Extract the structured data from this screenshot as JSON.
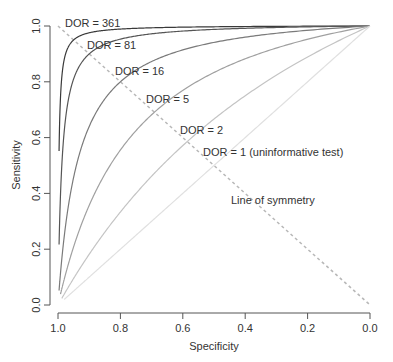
{
  "chart_data": {
    "type": "line",
    "title": "",
    "xlabel": "Specificity",
    "ylabel": "Sensitivity",
    "xlim": [
      1.0,
      0.0
    ],
    "ylim": [
      0.0,
      1.0
    ],
    "x_reversed": true,
    "grid": false,
    "legend": "none (direct labels)",
    "xticks": [
      "1.0",
      "0.8",
      "0.6",
      "0.4",
      "0.2",
      "0.0"
    ],
    "yticks": [
      "0.0",
      "0.2",
      "0.4",
      "0.6",
      "0.8",
      "1.0"
    ],
    "series": [
      {
        "name": "DOR = 361",
        "dor": 361,
        "label": "DOR = 361",
        "color": "#3a3a3a",
        "min_fpr": 0.0034,
        "label_pos": [
          65,
          27
        ]
      },
      {
        "name": "DOR = 81",
        "dor": 81,
        "label": "DOR = 81",
        "color": "#555555",
        "min_fpr": 0.0034,
        "label_pos": [
          87,
          49
        ]
      },
      {
        "name": "DOR = 16",
        "dor": 16,
        "label": "DOR = 16",
        "color": "#7a7a7a",
        "min_fpr": 0.0034,
        "label_pos": [
          115,
          75
        ]
      },
      {
        "name": "DOR = 5",
        "dor": 5,
        "label": "DOR = 5",
        "color": "#a0a0a0",
        "min_fpr": 0.008,
        "label_pos": [
          146,
          103
        ]
      },
      {
        "name": "DOR = 2",
        "dor": 2,
        "label": "DOR = 2",
        "color": "#c4c4c4",
        "min_fpr": 0.012,
        "label_pos": [
          180,
          134
        ]
      },
      {
        "name": "DOR = 1 (uninformative test)",
        "dor": 1,
        "label": "DOR = 1 (uninformative test)",
        "color": "#e0e0e0",
        "min_fpr": 0.02,
        "label_pos": [
          203,
          156
        ]
      }
    ],
    "annotations": [
      {
        "text": "Line of symmetry",
        "style": "dashed line from (spec 1.0, sens 1.0) to (spec 0.0, sens 0.0)",
        "label_pos": [
          231,
          204
        ]
      }
    ]
  }
}
